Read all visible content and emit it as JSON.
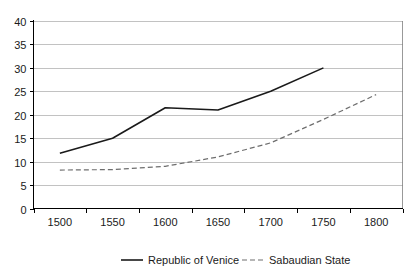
{
  "chart_data": {
    "type": "line",
    "title": "",
    "subtitle": "",
    "xlabel": "",
    "ylabel": "",
    "categories": [
      "1500",
      "1550",
      "1600",
      "1650",
      "1700",
      "1750",
      "1800"
    ],
    "x_tick_labels": [
      "1500",
      "1550",
      "1600",
      "1650",
      "1700",
      "1750",
      "1800"
    ],
    "y_tick_labels": [
      "0",
      "5",
      "10",
      "15",
      "20",
      "25",
      "30",
      "35",
      "40"
    ],
    "y_ticks": [
      0,
      5,
      10,
      15,
      20,
      25,
      30,
      35,
      40
    ],
    "ylim": [
      0,
      40
    ],
    "grid": "horizontal",
    "legend_position": "bottom-center",
    "series": [
      {
        "name": "Republic of Venice",
        "style": "solid",
        "color": "#1a1a1a",
        "x": [
          "1500",
          "1550",
          "1600",
          "1650",
          "1700",
          "1750"
        ],
        "values": [
          11.8,
          15.0,
          21.5,
          21.0,
          25.0,
          30.0
        ]
      },
      {
        "name": "Sabaudian State",
        "style": "dashed",
        "color": "#6e6e6e",
        "x": [
          "1500",
          "1550",
          "1600",
          "1650",
          "1700",
          "1750",
          "1800"
        ],
        "values": [
          8.2,
          8.3,
          9.0,
          11.0,
          14.0,
          19.0,
          24.3
        ]
      }
    ]
  },
  "legend": {
    "items": [
      {
        "label": "Republic of Venice",
        "marker": "solid-line-marker"
      },
      {
        "label": "Sabaudian State",
        "marker": "dashed-line-marker"
      }
    ]
  },
  "axes": {
    "y_axis_name": "value-axis",
    "x_axis_name": "year-axis"
  }
}
